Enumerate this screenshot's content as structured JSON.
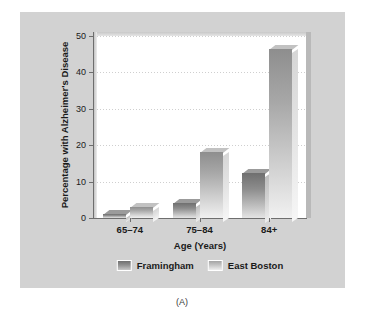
{
  "figure": {
    "caption": "(A)",
    "panel_bg": "#d2d2d2",
    "plot_bg": "#ffffff"
  },
  "chart_data": {
    "type": "bar",
    "title": "",
    "subtitle": "",
    "xlabel": "Age (Years)",
    "ylabel": "Percentage with Alzheimer's Disease",
    "categories": [
      "65–74",
      "75–84",
      "84+"
    ],
    "series": [
      {
        "name": "Framingham",
        "color": "#808080",
        "values": [
          1,
          4,
          12.5
        ]
      },
      {
        "name": "East Boston",
        "color": "#b8b8b8",
        "values": [
          3,
          18,
          46.5
        ]
      }
    ],
    "ylim": [
      0,
      50
    ],
    "yticks": [
      0,
      10,
      20,
      30,
      40,
      50
    ],
    "ytick_labels": [
      "0",
      "10",
      "20",
      "30",
      "40",
      "50"
    ],
    "grid": true,
    "grid_axis": "y",
    "grid_style": "dotted",
    "legend_position": "bottom-center",
    "legend_entries": [
      "Framingham",
      "East Boston"
    ]
  }
}
